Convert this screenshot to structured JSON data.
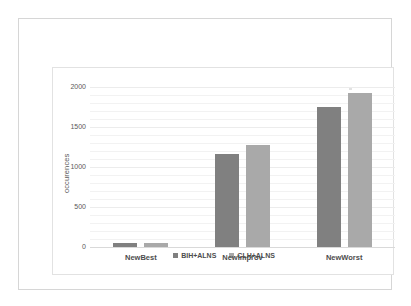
{
  "chart_data": {
    "type": "bar",
    "title": "",
    "subtitle": "",
    "xlabel": "",
    "ylabel": "occurences",
    "categories": [
      "NewBest",
      "NewImprov",
      "NewWorst"
    ],
    "series": [
      {
        "name": "BIH+ALNS",
        "color": "#808080",
        "values": [
          45,
          1165,
          1755
        ]
      },
      {
        "name": "CLH+ALNS",
        "color": "#a9a9a9",
        "values": [
          45,
          1280,
          1930
        ]
      }
    ],
    "ylim": [
      0,
      2000
    ],
    "yticks": [
      0,
      500,
      1000,
      1500,
      2000
    ],
    "ytick_labels": [
      "0",
      "500",
      "1000",
      "1500",
      "2000"
    ],
    "minor_gridlines": true,
    "grid": true,
    "legend_position": "bottom",
    "background": "#ffffff"
  },
  "axis": {
    "y_label": "occurences",
    "y_tick_0": "0",
    "y_tick_1": "500",
    "y_tick_2": "1000",
    "y_tick_3": "1500",
    "y_tick_4": "2000"
  },
  "categories": {
    "c0": "NewBest",
    "c1": "NewImprov",
    "c2": "NewWorst"
  },
  "legend": {
    "s0": "BIH+ALNS",
    "s1": "CLH+ALNS"
  }
}
